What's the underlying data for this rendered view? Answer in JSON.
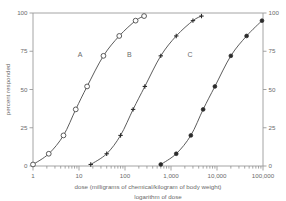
{
  "chart_data": {
    "type": "line",
    "title": "",
    "xlabel": "dose (milligrams of chemical/kilogram of body weight)",
    "xlabel_secondary": "logarithm of dose",
    "ylabel": "percent responded",
    "ylabel_right": "percent responded",
    "x_scale": "log",
    "xlim": [
      1,
      100000
    ],
    "ylim": [
      0,
      100
    ],
    "x_tick_labels": [
      "1",
      "10",
      "100",
      "1,000",
      "10,000",
      "100,000"
    ],
    "x_tick_values": [
      1,
      10,
      100,
      1000,
      10000,
      100000
    ],
    "y_tick_labels": [
      "0",
      "25",
      "50",
      "75",
      "100"
    ],
    "y_tick_values": [
      0,
      25,
      50,
      75,
      100
    ],
    "y_tick_labels_right": [
      "0",
      "25",
      "50",
      "75",
      "100"
    ],
    "grid": false,
    "legend": "inline-curve-labels",
    "series": [
      {
        "name": "A",
        "label": "A",
        "marker": "open-circle",
        "color": "#4a4a4a",
        "label_x": 10.5,
        "label_y": 71,
        "points": [
          {
            "x": 1.0,
            "y": 1
          },
          {
            "x": 2.2,
            "y": 8
          },
          {
            "x": 4.6,
            "y": 20
          },
          {
            "x": 8.5,
            "y": 37
          },
          {
            "x": 15,
            "y": 52
          },
          {
            "x": 34,
            "y": 72
          },
          {
            "x": 75,
            "y": 85
          },
          {
            "x": 170,
            "y": 95
          },
          {
            "x": 260,
            "y": 98
          }
        ]
      },
      {
        "name": "B",
        "label": "B",
        "marker": "cross",
        "color": "#2b2b2b",
        "label_x": 125,
        "label_y": 71,
        "points": [
          {
            "x": 18,
            "y": 1
          },
          {
            "x": 40,
            "y": 8
          },
          {
            "x": 80,
            "y": 20
          },
          {
            "x": 150,
            "y": 37
          },
          {
            "x": 270,
            "y": 52
          },
          {
            "x": 600,
            "y": 72
          },
          {
            "x": 1300,
            "y": 85
          },
          {
            "x": 3000,
            "y": 95
          },
          {
            "x": 4600,
            "y": 98
          }
        ]
      },
      {
        "name": "C",
        "label": "C",
        "marker": "filled-circle",
        "color": "#2b2b2b",
        "label_x": 2600,
        "label_y": 71,
        "points": [
          {
            "x": 600,
            "y": 1
          },
          {
            "x": 1300,
            "y": 8
          },
          {
            "x": 2700,
            "y": 20
          },
          {
            "x": 5000,
            "y": 37
          },
          {
            "x": 9000,
            "y": 52
          },
          {
            "x": 20000,
            "y": 72
          },
          {
            "x": 44000,
            "y": 85
          },
          {
            "x": 95000,
            "y": 95
          },
          {
            "x": 150000,
            "y": 98
          }
        ]
      }
    ]
  },
  "figure": {
    "background_color": "#ffffff",
    "axis_color": "#9a9a9a",
    "text_color": "#6b6b6b"
  }
}
